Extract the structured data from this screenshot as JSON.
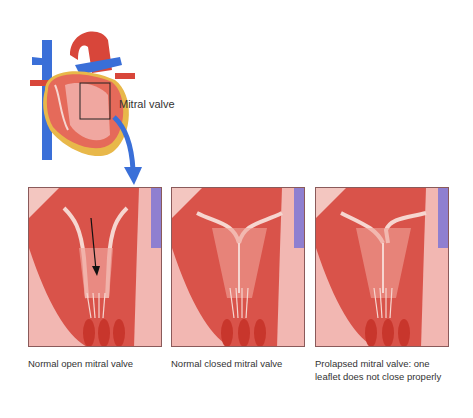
{
  "overview": {
    "label": "Mitral valve",
    "icon": "heart-illustration",
    "arrow": "blue-curved-arrow-icon",
    "colors": {
      "arrow": "#3a6fd8",
      "vessel_blue": "#3a6fd8",
      "tissue_red": "#d8463a",
      "tissue_pink": "#f2b7b2",
      "fat_yellow": "#e8b84a"
    }
  },
  "panels": [
    {
      "id": "open",
      "caption": "Normal open mitral valve",
      "state": "open",
      "has_flow_arrow": true
    },
    {
      "id": "closed",
      "caption": "Normal closed mitral valve",
      "state": "closed",
      "has_flow_arrow": false
    },
    {
      "id": "prolapsed",
      "caption": "Prolapsed mitral valve: one leaflet does not close properly",
      "state": "prolapsed",
      "has_flow_arrow": false
    }
  ]
}
